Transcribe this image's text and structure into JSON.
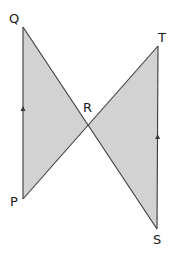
{
  "diagram": {
    "type": "geometry",
    "colors": {
      "fill": "#d2d2d2",
      "edge": "#3a3a3a",
      "label": "#1a1a1a"
    },
    "points": {
      "Q": {
        "label": "Q"
      },
      "P": {
        "label": "P"
      },
      "R": {
        "label": "R"
      },
      "T": {
        "label": "T"
      },
      "S": {
        "label": "S"
      }
    },
    "triangles": [
      {
        "name": "PQR",
        "vertices": [
          "P",
          "Q",
          "R"
        ]
      },
      {
        "name": "RST",
        "vertices": [
          "R",
          "S",
          "T"
        ]
      }
    ],
    "segments": [
      {
        "from": "P",
        "to": "Q"
      },
      {
        "from": "Q",
        "to": "S"
      },
      {
        "from": "P",
        "to": "T"
      },
      {
        "from": "S",
        "to": "T"
      }
    ],
    "parallel_marks": [
      {
        "segment": "PQ",
        "direction": "up"
      },
      {
        "segment": "ST",
        "direction": "up"
      }
    ]
  }
}
